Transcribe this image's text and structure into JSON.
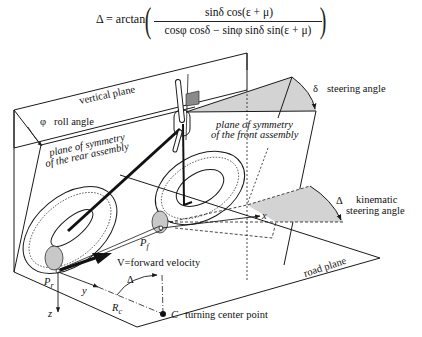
{
  "formula": {
    "lhs": "Δ = arctan",
    "numerator": "sinδ cos(ε + μ)",
    "denominator": "cosφ  cosδ − sinφ  sinδ  sin(ε + μ)"
  },
  "labels": {
    "vertical_plane": "vertical plane",
    "roll_angle_symbol": "φ",
    "roll_angle": "roll angle",
    "rear_plane_line1": "plane of symmetry",
    "rear_plane_line2": "of the rear assembly",
    "steering_angle_symbol": "δ",
    "steering_angle": "steering angle",
    "front_plane_line1": "plane of symmetry",
    "front_plane_line2": "of the front assembly",
    "kinematic_symbol": "Δ",
    "kinematic_line1": "kinematic",
    "kinematic_line2": "steering angle",
    "road_plane": "road plane",
    "x_axis": "x",
    "y_axis": "y",
    "z_axis": "z",
    "front_contact": "P",
    "front_contact_sub": "f",
    "rear_contact": "P",
    "rear_contact_sub": "r",
    "velocity": "V=forward velocity",
    "radius": "R",
    "radius_sub": "c",
    "delta_arc": "Δ",
    "turning_center_symbol": "C",
    "turning_center": "turning center point"
  },
  "colors": {
    "line": "#1a1a1a",
    "shade": "#d3d3d3",
    "dark_shade": "#8a8a8a",
    "background": "#ffffff"
  }
}
